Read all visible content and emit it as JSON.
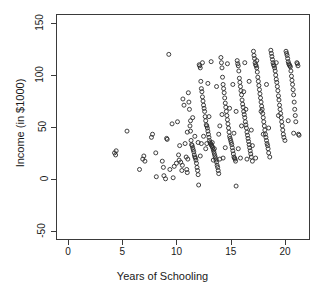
{
  "chart_data": {
    "type": "scatter",
    "title": "",
    "xlabel": "Years of Schooling",
    "ylabel": "Income (in $1000)",
    "xlim": [
      -1.1,
      22.3
    ],
    "ylim": [
      -59,
      159
    ],
    "xticks": [
      0,
      5,
      10,
      15,
      20
    ],
    "yticks": [
      -50,
      0,
      50,
      100,
      150
    ],
    "xtick_labels": [
      "0",
      "5",
      "10",
      "15",
      "20"
    ],
    "ytick_labels": [
      "-50",
      "0",
      "50",
      "100",
      "150"
    ],
    "grid": false,
    "legend": null,
    "marker": {
      "shape": "open-circle",
      "radius": 2.0,
      "color": "#2b2b2b",
      "fill": "none",
      "stroke_width": 0.9
    },
    "n_points": 283,
    "points": [
      [
        4.2,
        26
      ],
      [
        4.3,
        24
      ],
      [
        4.35,
        28
      ],
      [
        5.35,
        47
      ],
      [
        6.5,
        10
      ],
      [
        6.8,
        20
      ],
      [
        6.9,
        23
      ],
      [
        7.0,
        18
      ],
      [
        7.6,
        41
      ],
      [
        7.7,
        44
      ],
      [
        8.0,
        26
      ],
      [
        8.05,
        3
      ],
      [
        8.6,
        18
      ],
      [
        8.7,
        12
      ],
      [
        8.75,
        4
      ],
      [
        8.9,
        1
      ],
      [
        9.0,
        40
      ],
      [
        9.05,
        39
      ],
      [
        9.2,
        121
      ],
      [
        9.3,
        10
      ],
      [
        9.5,
        54
      ],
      [
        9.6,
        2
      ],
      [
        9.7,
        13
      ],
      [
        9.9,
        16
      ],
      [
        10.0,
        56
      ],
      [
        10.1,
        24
      ],
      [
        10.15,
        19
      ],
      [
        10.2,
        33
      ],
      [
        10.3,
        17
      ],
      [
        10.4,
        9
      ],
      [
        10.45,
        14
      ],
      [
        10.5,
        78
      ],
      [
        10.6,
        72
      ],
      [
        10.7,
        35
      ],
      [
        10.8,
        22
      ],
      [
        10.85,
        10
      ],
      [
        10.9,
        7
      ],
      [
        10.95,
        20
      ],
      [
        11.0,
        84
      ],
      [
        11.05,
        75
      ],
      [
        11.1,
        68
      ],
      [
        11.15,
        52
      ],
      [
        11.2,
        47
      ],
      [
        11.25,
        38
      ],
      [
        11.3,
        34
      ],
      [
        11.35,
        33
      ],
      [
        11.4,
        31
      ],
      [
        11.45,
        29
      ],
      [
        11.5,
        27
      ],
      [
        11.55,
        24
      ],
      [
        11.6,
        22
      ],
      [
        11.65,
        21
      ],
      [
        11.7,
        19
      ],
      [
        11.75,
        16
      ],
      [
        11.8,
        12
      ],
      [
        11.85,
        9
      ],
      [
        11.9,
        5
      ],
      [
        11.95,
        -5
      ],
      [
        12.0,
        111
      ],
      [
        12.05,
        110
      ],
      [
        12.1,
        108
      ],
      [
        12.15,
        95
      ],
      [
        12.2,
        88
      ],
      [
        12.25,
        85
      ],
      [
        12.3,
        80
      ],
      [
        12.35,
        76
      ],
      [
        12.4,
        72
      ],
      [
        12.45,
        69
      ],
      [
        12.5,
        66
      ],
      [
        12.55,
        61
      ],
      [
        12.6,
        57
      ],
      [
        12.65,
        53
      ],
      [
        12.7,
        52
      ],
      [
        12.75,
        50
      ],
      [
        12.8,
        47
      ],
      [
        12.85,
        44
      ],
      [
        12.9,
        41
      ],
      [
        12.95,
        38
      ],
      [
        13.0,
        36
      ],
      [
        13.05,
        35
      ],
      [
        13.1,
        34
      ],
      [
        13.15,
        33
      ],
      [
        13.2,
        32
      ],
      [
        13.25,
        31
      ],
      [
        13.3,
        29
      ],
      [
        13.35,
        27
      ],
      [
        13.4,
        25
      ],
      [
        13.45,
        23
      ],
      [
        13.5,
        21
      ],
      [
        13.55,
        19
      ],
      [
        13.6,
        17
      ],
      [
        13.65,
        14
      ],
      [
        13.7,
        12
      ],
      [
        13.75,
        9
      ],
      [
        13.8,
        6
      ],
      [
        13.9,
        20
      ],
      [
        14.0,
        118
      ],
      [
        14.05,
        113
      ],
      [
        14.1,
        108
      ],
      [
        14.15,
        99
      ],
      [
        14.2,
        92
      ],
      [
        14.25,
        88
      ],
      [
        14.3,
        84
      ],
      [
        14.35,
        79
      ],
      [
        14.4,
        74
      ],
      [
        14.45,
        70
      ],
      [
        14.5,
        66
      ],
      [
        14.55,
        62
      ],
      [
        14.6,
        58
      ],
      [
        14.65,
        54
      ],
      [
        14.7,
        50
      ],
      [
        14.75,
        46
      ],
      [
        14.8,
        42
      ],
      [
        14.85,
        40
      ],
      [
        14.9,
        38
      ],
      [
        14.95,
        36
      ],
      [
        15.0,
        34
      ],
      [
        15.05,
        31
      ],
      [
        15.1,
        28
      ],
      [
        15.15,
        25
      ],
      [
        15.2,
        22
      ],
      [
        15.25,
        21
      ],
      [
        15.3,
        20
      ],
      [
        15.35,
        18
      ],
      [
        15.4,
        -6
      ],
      [
        15.5,
        115
      ],
      [
        15.55,
        112
      ],
      [
        15.6,
        110
      ],
      [
        15.65,
        105
      ],
      [
        15.7,
        98
      ],
      [
        15.75,
        94
      ],
      [
        15.8,
        90
      ],
      [
        15.85,
        86
      ],
      [
        15.9,
        82
      ],
      [
        15.95,
        77
      ],
      [
        16.0,
        73
      ],
      [
        16.05,
        70
      ],
      [
        16.1,
        66
      ],
      [
        16.15,
        63
      ],
      [
        16.2,
        60
      ],
      [
        16.25,
        56
      ],
      [
        16.3,
        53
      ],
      [
        16.35,
        50
      ],
      [
        16.4,
        46
      ],
      [
        16.45,
        43
      ],
      [
        16.5,
        40
      ],
      [
        16.55,
        37
      ],
      [
        16.6,
        34
      ],
      [
        16.65,
        31
      ],
      [
        16.7,
        28
      ],
      [
        16.75,
        25
      ],
      [
        16.8,
        22
      ],
      [
        16.9,
        18
      ],
      [
        17.0,
        124
      ],
      [
        17.05,
        120
      ],
      [
        17.1,
        117
      ],
      [
        17.15,
        113
      ],
      [
        17.2,
        111
      ],
      [
        17.25,
        110
      ],
      [
        17.3,
        108
      ],
      [
        17.35,
        104
      ],
      [
        17.4,
        99
      ],
      [
        17.45,
        95
      ],
      [
        17.5,
        91
      ],
      [
        17.55,
        87
      ],
      [
        17.6,
        83
      ],
      [
        17.65,
        79
      ],
      [
        17.7,
        75
      ],
      [
        17.75,
        71
      ],
      [
        17.8,
        68
      ],
      [
        17.85,
        64
      ],
      [
        17.9,
        60
      ],
      [
        17.95,
        56
      ],
      [
        18.0,
        52
      ],
      [
        18.05,
        48
      ],
      [
        18.1,
        44
      ],
      [
        18.15,
        41
      ],
      [
        18.2,
        38
      ],
      [
        18.25,
        35
      ],
      [
        18.3,
        33
      ],
      [
        18.35,
        30
      ],
      [
        18.4,
        26
      ],
      [
        18.5,
        22
      ],
      [
        18.6,
        125
      ],
      [
        18.65,
        122
      ],
      [
        18.7,
        119
      ],
      [
        18.75,
        116
      ],
      [
        18.8,
        113
      ],
      [
        18.85,
        111
      ],
      [
        18.9,
        110
      ],
      [
        18.95,
        108
      ],
      [
        19.0,
        105
      ],
      [
        19.05,
        101
      ],
      [
        19.1,
        97
      ],
      [
        19.15,
        94
      ],
      [
        19.2,
        90
      ],
      [
        19.25,
        86
      ],
      [
        19.3,
        81
      ],
      [
        19.35,
        77
      ],
      [
        19.4,
        72
      ],
      [
        19.45,
        68
      ],
      [
        19.5,
        64
      ],
      [
        19.55,
        60
      ],
      [
        19.6,
        56
      ],
      [
        19.65,
        52
      ],
      [
        19.7,
        48
      ],
      [
        19.75,
        44
      ],
      [
        19.8,
        41
      ],
      [
        19.9,
        38
      ],
      [
        20.0,
        124
      ],
      [
        20.05,
        122
      ],
      [
        20.1,
        120
      ],
      [
        20.15,
        117
      ],
      [
        20.2,
        114
      ],
      [
        20.25,
        112
      ],
      [
        20.3,
        111
      ],
      [
        20.35,
        110
      ],
      [
        20.4,
        109
      ],
      [
        20.45,
        105
      ],
      [
        20.5,
        100
      ],
      [
        20.55,
        96
      ],
      [
        20.6,
        92
      ],
      [
        20.65,
        87
      ],
      [
        20.7,
        82
      ],
      [
        20.75,
        75
      ],
      [
        20.8,
        68
      ],
      [
        20.85,
        62
      ],
      [
        20.9,
        56
      ],
      [
        21.0,
        113
      ],
      [
        21.05,
        112
      ],
      [
        21.1,
        110
      ],
      [
        21.15,
        44
      ],
      [
        21.2,
        43
      ],
      [
        12.3,
        113
      ],
      [
        13.1,
        114
      ],
      [
        14.6,
        112
      ],
      [
        16.2,
        113
      ],
      [
        17.3,
        115
      ],
      [
        19.1,
        113
      ],
      [
        11.2,
        57
      ],
      [
        12.8,
        93
      ],
      [
        13.6,
        90
      ],
      [
        15.1,
        92
      ],
      [
        16.6,
        95
      ],
      [
        18.2,
        92
      ],
      [
        12.1,
        23
      ],
      [
        13.3,
        19
      ],
      [
        14.2,
        21
      ],
      [
        15.8,
        21
      ],
      [
        16.4,
        20
      ],
      [
        17.2,
        21
      ],
      [
        11.6,
        42
      ],
      [
        12.4,
        42
      ],
      [
        13.8,
        44
      ],
      [
        15.2,
        45
      ],
      [
        16.8,
        48
      ],
      [
        18.4,
        50
      ],
      [
        12.6,
        30
      ],
      [
        13.4,
        30
      ],
      [
        14.4,
        31
      ],
      [
        15.6,
        30
      ],
      [
        16.9,
        33
      ],
      [
        11.4,
        60
      ],
      [
        12.9,
        61
      ],
      [
        14.1,
        63
      ],
      [
        15.4,
        66
      ],
      [
        16.3,
        68
      ],
      [
        17.7,
        66
      ],
      [
        19.3,
        62
      ],
      [
        20.2,
        57
      ],
      [
        10.9,
        46
      ],
      [
        11.9,
        36
      ],
      [
        12.2,
        35
      ],
      [
        12.7,
        35
      ],
      [
        13.2,
        36
      ],
      [
        14.8,
        69
      ],
      [
        16.1,
        85
      ],
      [
        17.9,
        44
      ],
      [
        20.7,
        45
      ],
      [
        13.9,
        52
      ],
      [
        15.9,
        52
      ]
    ]
  },
  "axes": {
    "x_axis_name": "x-axis",
    "y_axis_name": "y-axis"
  }
}
